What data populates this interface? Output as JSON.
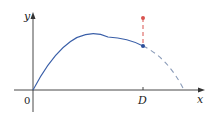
{
  "diagram": {
    "axes": {
      "x_label": "x",
      "y_label": "y",
      "origin_label": "0"
    },
    "tick": {
      "label": "D"
    },
    "colors": {
      "curve": "#3a5fa8",
      "dashed_curve": "#8a9bb8",
      "red_segment": "#d9534f",
      "axis": "#333333"
    },
    "elements": [
      "parabolic trajectory from origin (solid blue) continuing dashed to x-axis",
      "blue point on curve at x = D",
      "red dashed vertical segment above the blue point ending in a red point"
    ]
  }
}
